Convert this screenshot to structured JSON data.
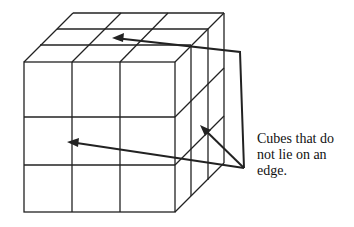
{
  "diagram": {
    "label_line1": "Cubes that do",
    "label_line2": "not lie on an",
    "label_line3": "edge.",
    "stroke_color": "#222222"
  }
}
